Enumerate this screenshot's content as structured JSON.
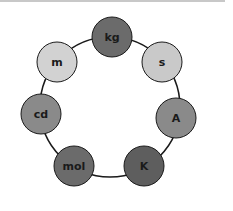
{
  "diagram": {
    "type": "ring",
    "ring": {
      "cx": 110,
      "cy": 107,
      "r": 70,
      "stroke": "#1a1a1a"
    },
    "nodes": [
      {
        "id": "kg",
        "label": "kg",
        "cx": 112,
        "cy": 37,
        "r": 20,
        "fill": "#6b6b6b"
      },
      {
        "id": "s",
        "label": "s",
        "cx": 162,
        "cy": 62,
        "r": 20,
        "fill": "#c9c9c9"
      },
      {
        "id": "A",
        "label": "A",
        "cx": 176,
        "cy": 118,
        "r": 20,
        "fill": "#8a8a8a"
      },
      {
        "id": "K",
        "label": "K",
        "cx": 144,
        "cy": 166,
        "r": 20,
        "fill": "#5e5e5e"
      },
      {
        "id": "mol",
        "label": "mol",
        "cx": 74,
        "cy": 166,
        "r": 20,
        "fill": "#6b6b6b"
      },
      {
        "id": "cd",
        "label": "cd",
        "cx": 41,
        "cy": 114,
        "r": 20,
        "fill": "#8a8a8a"
      },
      {
        "id": "m",
        "label": "m",
        "cx": 57,
        "cy": 62,
        "r": 20,
        "fill": "#d2d2d2"
      }
    ]
  }
}
